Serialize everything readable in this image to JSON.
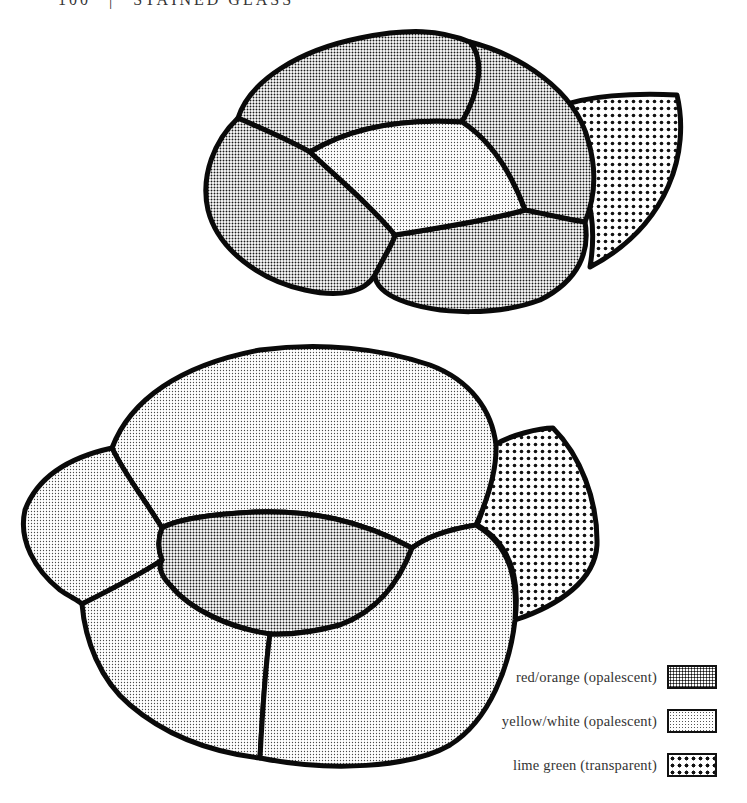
{
  "header": {
    "page_number": "100",
    "separator": "|",
    "running_title": "STAINED GLASS"
  },
  "diagram": {
    "figures": [
      {
        "name": "top-flower",
        "regions": [
          {
            "id": "top-petal-upper",
            "material": "red/orange (opalescent)"
          },
          {
            "id": "top-petal-left",
            "material": "red/orange (opalescent)"
          },
          {
            "id": "top-petal-right",
            "material": "red/orange (opalescent)"
          },
          {
            "id": "top-petal-lower",
            "material": "red/orange (opalescent)"
          },
          {
            "id": "top-center",
            "material": "yellow/white (opalescent)"
          },
          {
            "id": "top-leaf",
            "material": "lime green (transparent)"
          }
        ]
      },
      {
        "name": "bottom-flower",
        "regions": [
          {
            "id": "bottom-petal-upper",
            "material": "yellow/white (opalescent)"
          },
          {
            "id": "bottom-petal-left",
            "material": "yellow/white (opalescent)"
          },
          {
            "id": "bottom-petal-lower-left",
            "material": "yellow/white (opalescent)"
          },
          {
            "id": "bottom-petal-lower-right",
            "material": "yellow/white (opalescent)"
          },
          {
            "id": "bottom-center",
            "material": "red/orange (opalescent)"
          },
          {
            "id": "bottom-leaf",
            "material": "lime green (transparent)"
          }
        ]
      }
    ]
  },
  "legend": {
    "items": [
      {
        "label": "red/orange (opalescent)",
        "pattern": "fine-dense-dots"
      },
      {
        "label": "yellow/white (opalescent)",
        "pattern": "fine-light-dots"
      },
      {
        "label": "lime green (transparent)",
        "pattern": "coarse-dots"
      }
    ]
  }
}
